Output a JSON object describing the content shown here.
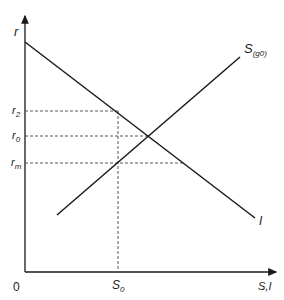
{
  "diagram": {
    "type": "economics supply-demand (loanable funds) diagram",
    "axes": {
      "y_label": "r",
      "x_label": "S,I",
      "origin_label": "0"
    },
    "curves": {
      "saving": {
        "label": "S",
        "subscript": "(g0)",
        "label_full": "S(g0)"
      },
      "investment": {
        "label": "I"
      }
    },
    "y_ticks": [
      {
        "base": "r",
        "sub": "2",
        "full": "r2"
      },
      {
        "base": "r",
        "sub": "0",
        "full": "r0"
      },
      {
        "base": "r",
        "sub": "m",
        "full": "rm"
      }
    ],
    "x_ticks": [
      {
        "base": "S",
        "sub": "0",
        "full": "S0"
      }
    ],
    "colors": {
      "line": "#1a1a1a",
      "dashed": "#444444",
      "text": "#222222",
      "background": "#ffffff"
    }
  }
}
